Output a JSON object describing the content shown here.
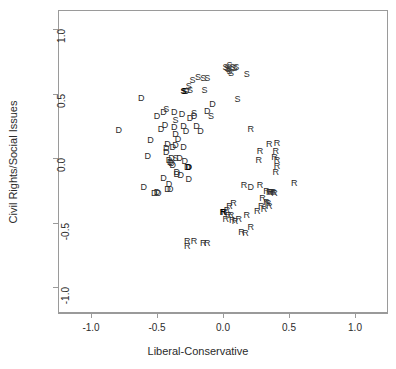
{
  "chart_data": {
    "type": "scatter",
    "title": "",
    "xlabel": "Liberal-Conservative",
    "ylabel": "Civil Rights/Social Issues",
    "xlim": [
      -1.25,
      1.25
    ],
    "ylim": [
      -1.2,
      1.15
    ],
    "xticks": [
      "-1.0",
      "-0.5",
      "0.0",
      "0.5",
      "1.0"
    ],
    "xtickvalues": [
      -1.0,
      -0.5,
      0.0,
      0.5,
      1.0
    ],
    "yticks": [
      "-1.0",
      "-0.5",
      "0.0",
      "0.5",
      "1.0"
    ],
    "ytickvalues": [
      -1.0,
      -0.5,
      0.0,
      0.5,
      1.0
    ],
    "grid": false,
    "legend": "none",
    "point_style": "text-marker",
    "marker_labels": [
      "D",
      "R",
      "S"
    ],
    "series": [
      {
        "name": "D",
        "label": "D",
        "points": [
          {
            "x": -0.79,
            "y": 0.22
          },
          {
            "x": -0.62,
            "y": 0.47
          },
          {
            "x": -0.55,
            "y": 0.14
          },
          {
            "x": -0.57,
            "y": 0.02
          },
          {
            "x": -0.5,
            "y": 0.33
          },
          {
            "x": -0.47,
            "y": 0.23
          },
          {
            "x": -0.45,
            "y": 0.36
          },
          {
            "x": -0.44,
            "y": 0.26
          },
          {
            "x": -0.43,
            "y": 0.08
          },
          {
            "x": -0.43,
            "y": 0.05
          },
          {
            "x": -0.42,
            "y": 0.11
          },
          {
            "x": -0.41,
            "y": -0.01
          },
          {
            "x": -0.4,
            "y": -0.03
          },
          {
            "x": -0.39,
            "y": -0.04
          },
          {
            "x": -0.39,
            "y": 0.0
          },
          {
            "x": -0.38,
            "y": -0.05
          },
          {
            "x": -0.38,
            "y": 0.09
          },
          {
            "x": -0.37,
            "y": 0.36
          },
          {
            "x": -0.37,
            "y": 0.24
          },
          {
            "x": -0.36,
            "y": 0.19
          },
          {
            "x": -0.36,
            "y": 0.1
          },
          {
            "x": -0.35,
            "y": -0.11
          },
          {
            "x": -0.35,
            "y": -0.12
          },
          {
            "x": -0.34,
            "y": 0.15
          },
          {
            "x": -0.33,
            "y": 0.0
          },
          {
            "x": -0.32,
            "y": -0.13
          },
          {
            "x": -0.31,
            "y": 0.34
          },
          {
            "x": -0.3,
            "y": 0.25
          },
          {
            "x": -0.3,
            "y": 0.09
          },
          {
            "x": -0.29,
            "y": -0.02
          },
          {
            "x": -0.28,
            "y": 0.21
          },
          {
            "x": -0.27,
            "y": -0.07
          },
          {
            "x": -0.26,
            "y": -0.16
          },
          {
            "x": -0.25,
            "y": 0.31
          },
          {
            "x": -0.22,
            "y": 0.33
          },
          {
            "x": -0.2,
            "y": 0.25
          },
          {
            "x": -0.17,
            "y": 0.21
          },
          {
            "x": -0.12,
            "y": 0.37
          },
          {
            "x": -0.08,
            "y": 0.42
          },
          {
            "x": -0.6,
            "y": -0.22
          },
          {
            "x": -0.52,
            "y": -0.27
          },
          {
            "x": -0.5,
            "y": -0.26
          },
          {
            "x": -0.49,
            "y": -0.27
          },
          {
            "x": -0.42,
            "y": -0.24
          },
          {
            "x": -0.4,
            "y": -0.24
          },
          {
            "x": -0.41,
            "y": -0.2
          },
          {
            "x": -0.45,
            "y": -0.15
          },
          {
            "x": -0.28,
            "y": 0.52
          },
          {
            "x": 0.21,
            "y": -0.22
          }
        ]
      },
      {
        "name": "R",
        "label": "R",
        "points": [
          {
            "x": 0.21,
            "y": 0.23
          },
          {
            "x": 0.28,
            "y": 0.06
          },
          {
            "x": 0.27,
            "y": -0.01
          },
          {
            "x": 0.35,
            "y": 0.11
          },
          {
            "x": 0.41,
            "y": 0.12
          },
          {
            "x": 0.4,
            "y": 0.06
          },
          {
            "x": 0.39,
            "y": 0.01
          },
          {
            "x": 0.41,
            "y": -0.01
          },
          {
            "x": 0.41,
            "y": -0.06
          },
          {
            "x": 0.4,
            "y": -0.11
          },
          {
            "x": 0.54,
            "y": -0.19
          },
          {
            "x": 0.28,
            "y": -0.21
          },
          {
            "x": 0.33,
            "y": -0.25
          },
          {
            "x": 0.35,
            "y": -0.26
          },
          {
            "x": 0.36,
            "y": -0.26
          },
          {
            "x": 0.37,
            "y": -0.26
          },
          {
            "x": 0.38,
            "y": -0.26
          },
          {
            "x": 0.3,
            "y": -0.31
          },
          {
            "x": 0.33,
            "y": -0.34
          },
          {
            "x": 0.34,
            "y": -0.35
          },
          {
            "x": 0.35,
            "y": -0.37
          },
          {
            "x": 0.29,
            "y": -0.37
          },
          {
            "x": 0.31,
            "y": -0.39
          },
          {
            "x": 0.26,
            "y": -0.41
          },
          {
            "x": 0.08,
            "y": -0.35
          },
          {
            "x": 0.05,
            "y": -0.37
          },
          {
            "x": 0.03,
            "y": -0.4
          },
          {
            "x": 0.01,
            "y": -0.42
          },
          {
            "x": 0.04,
            "y": -0.44
          },
          {
            "x": 0.06,
            "y": -0.44
          },
          {
            "x": 0.02,
            "y": -0.47
          },
          {
            "x": 0.07,
            "y": -0.48
          },
          {
            "x": 0.09,
            "y": -0.49
          },
          {
            "x": 0.12,
            "y": -0.47
          },
          {
            "x": 0.18,
            "y": -0.44
          },
          {
            "x": 0.21,
            "y": -0.53
          },
          {
            "x": 0.14,
            "y": -0.57
          },
          {
            "x": 0.17,
            "y": -0.58
          },
          {
            "x": -0.27,
            "y": -0.64
          },
          {
            "x": -0.27,
            "y": -0.68
          },
          {
            "x": -0.22,
            "y": -0.64
          },
          {
            "x": -0.15,
            "y": -0.66
          },
          {
            "x": -0.12,
            "y": -0.66
          },
          {
            "x": 0.39,
            "y": -0.27
          },
          {
            "x": 0.16,
            "y": -0.21
          }
        ]
      },
      {
        "name": "S",
        "label": "S",
        "points": [
          {
            "x": -0.43,
            "y": 0.38
          },
          {
            "x": -0.36,
            "y": 0.3
          },
          {
            "x": -0.29,
            "y": 0.52
          },
          {
            "x": -0.26,
            "y": 0.56
          },
          {
            "x": -0.25,
            "y": 0.53
          },
          {
            "x": -0.23,
            "y": 0.61
          },
          {
            "x": -0.19,
            "y": 0.63
          },
          {
            "x": -0.15,
            "y": 0.62
          },
          {
            "x": -0.12,
            "y": 0.62
          },
          {
            "x": -0.14,
            "y": 0.53
          },
          {
            "x": -0.09,
            "y": 0.33
          },
          {
            "x": -0.22,
            "y": 0.35
          },
          {
            "x": 0.02,
            "y": 0.71
          },
          {
            "x": 0.03,
            "y": 0.7
          },
          {
            "x": 0.04,
            "y": 0.69
          },
          {
            "x": 0.05,
            "y": 0.68
          },
          {
            "x": 0.05,
            "y": 0.72
          },
          {
            "x": 0.06,
            "y": 0.66
          },
          {
            "x": 0.07,
            "y": 0.71
          },
          {
            "x": 0.09,
            "y": 0.7
          },
          {
            "x": 0.1,
            "y": 0.71
          },
          {
            "x": 0.18,
            "y": 0.65
          },
          {
            "x": 0.11,
            "y": 0.46
          },
          {
            "x": -0.36,
            "y": 0.0
          }
        ]
      }
    ],
    "highlighted_points": [
      {
        "label": "S",
        "x": -0.3,
        "y": 0.52,
        "bold": true
      },
      {
        "label": "D",
        "x": -0.26,
        "y": -0.07,
        "bold": true
      },
      {
        "label": "R",
        "x": 0.0,
        "y": -0.42,
        "bold": true
      }
    ]
  }
}
